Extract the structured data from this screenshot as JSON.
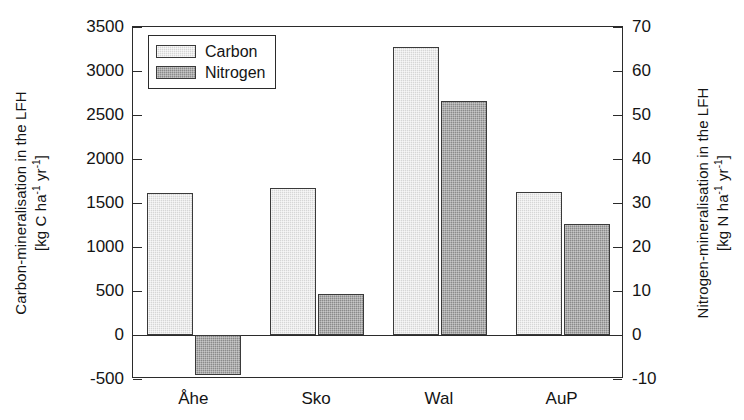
{
  "chart_data": {
    "type": "bar",
    "title": "",
    "categories": [
      "Åhe",
      "Sko",
      "Wal",
      "AuP"
    ],
    "series": [
      {
        "name": "Carbon",
        "axis": "left",
        "values": [
          1610,
          1675,
          3270,
          1625
        ]
      },
      {
        "name": "Nitrogen",
        "axis": "right",
        "values": [
          -9.1,
          9.3,
          53.2,
          25.3
        ]
      }
    ],
    "nitrogen_values_left_scale": [
      -455,
      465,
      2660,
      1265
    ],
    "xlabel": "",
    "ylabel": "Carbon-mineralisation in the LFH [kg C ha-1 yr-1]",
    "y2label": "Nitrogen-mineralisation in the LFH [kg N ha-1 yr-1]",
    "ylim": [
      -500,
      3500
    ],
    "y2lim": [
      -10,
      70
    ],
    "yticks": [
      3500,
      3000,
      2500,
      2000,
      1500,
      1000,
      500,
      0,
      -500
    ],
    "y2ticks": [
      70,
      60,
      50,
      40,
      30,
      20,
      10,
      0,
      -10
    ],
    "grid": false,
    "legend_position": "top-left"
  },
  "axes": {
    "left": {
      "title_line1": "Carbon-mineralisation in the LFH",
      "title_line2_pre": "[kg C ha",
      "title_sup1": "-1",
      "title_mid": " yr",
      "title_sup2": "-1",
      "title_end": "]",
      "ticks": [
        "3500",
        "3000",
        "2500",
        "2000",
        "1500",
        "1000",
        "500",
        "0",
        "-500"
      ]
    },
    "right": {
      "title_line1": "Nitrogen-mineralisation in the LFH",
      "title_line2_pre": "[kg N ha",
      "title_sup1": "-1",
      "title_mid": " yr",
      "title_sup2": "-1",
      "title_end": "]",
      "ticks": [
        "70",
        "60",
        "50",
        "40",
        "30",
        "20",
        "10",
        "0",
        "-10"
      ]
    },
    "categories": [
      "Åhe",
      "Sko",
      "Wal",
      "AuP"
    ]
  },
  "legend": {
    "items": [
      {
        "label": "Carbon",
        "color": "#d6d6d6"
      },
      {
        "label": "Nitrogen",
        "color": "#8a8a8a"
      }
    ]
  },
  "colors": {
    "carbon": "#d6d6d6",
    "nitrogen": "#8a8a8a",
    "axis": "#2b2b2b",
    "background": "#ffffff"
  }
}
